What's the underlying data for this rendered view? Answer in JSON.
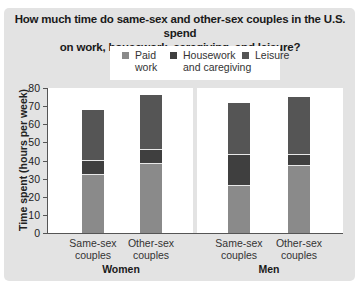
{
  "chart_data": {
    "type": "bar",
    "stacked": true,
    "title": "How much time do same-sex and other-sex couples in the U.S. spend on work, housework, caregiving, and leisure?",
    "title_lines": [
      "How much time do same-sex and other-sex couples in the U.S. spend",
      "on work, housework, caregiving, and leisure?"
    ],
    "xlabel": "",
    "ylabel": "Time spent (hours per week)",
    "ylim": [
      0,
      80
    ],
    "yticks": [
      0,
      10,
      20,
      30,
      40,
      50,
      60,
      70,
      80
    ],
    "grid": false,
    "legend_position": "top",
    "groups": [
      {
        "name": "Women",
        "categories": [
          "Same-sex couples",
          "Other-sex couples"
        ]
      },
      {
        "name": "Men",
        "categories": [
          "Same-sex couples",
          "Other-sex couples"
        ]
      }
    ],
    "categories": [
      "Women · Same-sex couples",
      "Women · Other-sex couples",
      "Men · Same-sex couples",
      "Men · Other-sex couples"
    ],
    "series": [
      {
        "name": "Paid work",
        "color": "#8a8a8a",
        "values": [
          32,
          38,
          26,
          37
        ]
      },
      {
        "name": "Housework and caregiving",
        "color": "#3f3f3f",
        "values": [
          8,
          8,
          17,
          6
        ]
      },
      {
        "name": "Leisure",
        "color": "#555555",
        "values": [
          28,
          30,
          29,
          32
        ]
      }
    ],
    "totals": [
      68,
      76,
      72,
      75
    ]
  },
  "title": {
    "line1": "How much time do same-sex and other-sex couples in the U.S. spend",
    "line2": "on work, housework, caregiving, and leisure?"
  },
  "legend": {
    "paid_line1": "Paid",
    "paid_line2": "work",
    "house_line1": "Housework",
    "house_line2": "and caregiving",
    "leisure": "Leisure"
  },
  "axis": {
    "ylabel": "Time spent (hours per week)",
    "ticks": [
      "0",
      "10",
      "20",
      "30",
      "40",
      "50",
      "60",
      "70",
      "80"
    ]
  },
  "labels": {
    "cat_same_1": "Same-sex",
    "cat_same_2": "couples",
    "cat_other_1": "Other-sex",
    "cat_other_2": "couples",
    "group_women": "Women",
    "group_men": "Men"
  }
}
